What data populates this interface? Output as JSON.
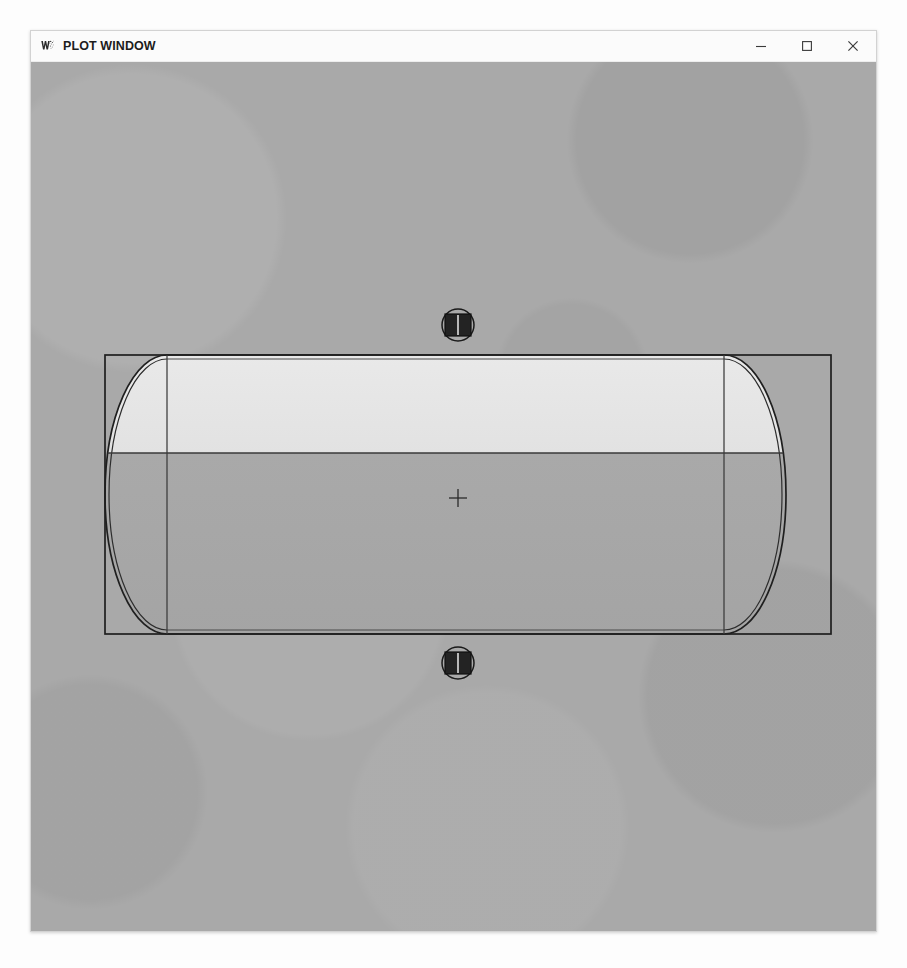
{
  "window": {
    "title": "PLOT WINDOW",
    "icon": "app-logo-icon",
    "controls": {
      "minimize": "–",
      "maximize": "□",
      "close": "✕"
    }
  },
  "canvas": {
    "background_color": "#a9a9a9",
    "line_color": "#1a1a1a"
  },
  "drawing": {
    "type": "horizontal-vessel-side-elevation",
    "description": "Horizontal cylindrical tank with elliptical dished heads, shown in side elevation with liquid level",
    "bounding_box": {
      "x": 74,
      "y": 293,
      "width": 726,
      "height": 279
    },
    "shell": {
      "left_tangent_x": 136,
      "right_tangent_x": 693,
      "top_y": 293,
      "bottom_y": 572
    },
    "heads": {
      "style": "elliptical-2:1",
      "left_depth": 62,
      "right_depth": 62,
      "double_line_offset": 4
    },
    "liquid": {
      "level_y": 391,
      "vapor_color": "#e9e9e9",
      "liquid_color": "#a6a6a6",
      "fill_fraction": 0.65
    },
    "center_mark": {
      "x": 427,
      "y": 436,
      "glyph": "+"
    },
    "nozzles": [
      {
        "name": "top-nozzle",
        "cx": 427,
        "cy": 263,
        "r": 16
      },
      {
        "name": "bottom-nozzle",
        "cx": 427,
        "cy": 601,
        "r": 16
      }
    ]
  }
}
